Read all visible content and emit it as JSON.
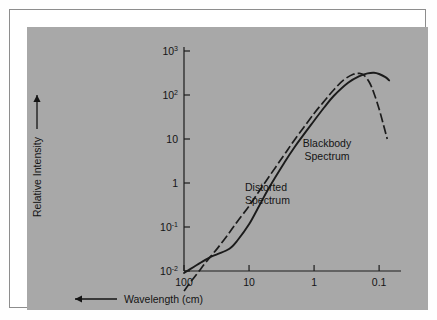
{
  "figure": {
    "background_color": "#a8a8a8",
    "page_color": "#ffffff",
    "border_color": "#8d8d8d",
    "ink_color": "#1b1b1b"
  },
  "axes": {
    "y_title": "Relative Intensity",
    "y_title_arrow": "up-arrow",
    "x_title": "Wavelength (cm)",
    "x_title_arrow": "left-arrow",
    "y_ticks": [
      {
        "mantissa": "10",
        "exponent": "3",
        "value": 1000
      },
      {
        "mantissa": "10",
        "exponent": "2",
        "value": 100
      },
      {
        "mantissa": "10",
        "exponent": "",
        "value": 10
      },
      {
        "mantissa": "1",
        "exponent": "",
        "value": 1
      },
      {
        "mantissa": "10",
        "exponent": "-1",
        "value": 0.1
      },
      {
        "mantissa": "10",
        "exponent": "-2",
        "value": 0.01
      }
    ],
    "x_ticks": [
      {
        "label": "100",
        "value": 100
      },
      {
        "label": "10",
        "value": 10
      },
      {
        "label": "1",
        "value": 1
      },
      {
        "label": "0.1",
        "value": 0.1
      }
    ]
  },
  "annotations": [
    {
      "name": "blackbody-label",
      "line1": "Blackbody",
      "line2": "Spectrum",
      "align": "center"
    },
    {
      "name": "distorted-label",
      "line1": "Distorted",
      "line2": "Spectrum",
      "align": "start"
    }
  ],
  "chart_data": {
    "type": "line",
    "title": "",
    "xlabel": "Wavelength (cm)",
    "ylabel": "Relative Intensity",
    "xscale": "log",
    "yscale": "log",
    "x_axis_direction": "decreasing",
    "xlim": [
      100,
      0.04
    ],
    "ylim": [
      0.01,
      1000
    ],
    "grid": false,
    "legend": "inline-annotations",
    "series": [
      {
        "name": "Blackbody Spectrum",
        "style": "solid",
        "points": [
          {
            "wavelength": 100,
            "intensity": 0.009
          },
          {
            "wavelength": 70,
            "intensity": 0.0125
          },
          {
            "wavelength": 50,
            "intensity": 0.017
          },
          {
            "wavelength": 40,
            "intensity": 0.0205
          },
          {
            "wavelength": 30,
            "intensity": 0.0245
          },
          {
            "wavelength": 20,
            "intensity": 0.032
          },
          {
            "wavelength": 15,
            "intensity": 0.05
          },
          {
            "wavelength": 10,
            "intensity": 0.115
          },
          {
            "wavelength": 7,
            "intensity": 0.3
          },
          {
            "wavelength": 5,
            "intensity": 0.75
          },
          {
            "wavelength": 3,
            "intensity": 2.6
          },
          {
            "wavelength": 2,
            "intensity": 6.5
          },
          {
            "wavelength": 1,
            "intensity": 26
          },
          {
            "wavelength": 0.7,
            "intensity": 52
          },
          {
            "wavelength": 0.5,
            "intensity": 95
          },
          {
            "wavelength": 0.3,
            "intensity": 190
          },
          {
            "wavelength": 0.2,
            "intensity": 270
          },
          {
            "wavelength": 0.15,
            "intensity": 310
          },
          {
            "wavelength": 0.12,
            "intensity": 320
          },
          {
            "wavelength": 0.1,
            "intensity": 300
          },
          {
            "wavelength": 0.08,
            "intensity": 255
          },
          {
            "wavelength": 0.07,
            "intensity": 215
          }
        ]
      },
      {
        "name": "Distorted Spectrum",
        "style": "dash-dot",
        "points": [
          {
            "wavelength": 100,
            "intensity": 0.0035
          },
          {
            "wavelength": 80,
            "intensity": 0.0055
          },
          {
            "wavelength": 60,
            "intensity": 0.0095
          },
          {
            "wavelength": 45,
            "intensity": 0.0165
          },
          {
            "wavelength": 30,
            "intensity": 0.034
          },
          {
            "wavelength": 20,
            "intensity": 0.075
          },
          {
            "wavelength": 15,
            "intensity": 0.135
          },
          {
            "wavelength": 10,
            "intensity": 0.3
          },
          {
            "wavelength": 7,
            "intensity": 0.65
          },
          {
            "wavelength": 5,
            "intensity": 1.35
          },
          {
            "wavelength": 3,
            "intensity": 4.0
          },
          {
            "wavelength": 2,
            "intensity": 9.5
          },
          {
            "wavelength": 1,
            "intensity": 38
          },
          {
            "wavelength": 0.7,
            "intensity": 72
          },
          {
            "wavelength": 0.5,
            "intensity": 130
          },
          {
            "wavelength": 0.35,
            "intensity": 220
          },
          {
            "wavelength": 0.25,
            "intensity": 295
          },
          {
            "wavelength": 0.2,
            "intensity": 310
          },
          {
            "wavelength": 0.17,
            "intensity": 280
          },
          {
            "wavelength": 0.14,
            "intensity": 190
          },
          {
            "wavelength": 0.12,
            "intensity": 110
          },
          {
            "wavelength": 0.1,
            "intensity": 48
          },
          {
            "wavelength": 0.085,
            "intensity": 20
          },
          {
            "wavelength": 0.075,
            "intensity": 10
          }
        ]
      }
    ]
  }
}
